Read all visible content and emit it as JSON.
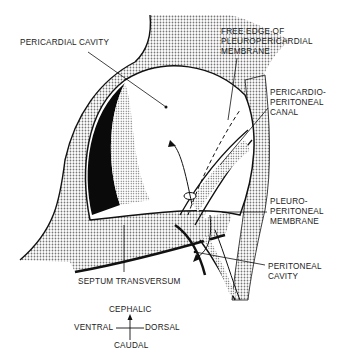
{
  "labels": {
    "pericardial_cavity": "PERICARDIAL CAVITY",
    "free_edge_1": "FREE EDGE OF",
    "free_edge_2": "PLEUROPERICARDIAL",
    "free_edge_3": "MEMBRANE",
    "pp_canal_1": "PERICARDIO-",
    "pp_canal_2": "PERITONEAL",
    "pp_canal_3": "CANAL",
    "pleuro_1": "PLEURO-",
    "pleuro_2": "PERITONEAL",
    "pleuro_3": "MEMBRANE",
    "septum": "SEPTUM TRANSVERSUM",
    "peritoneal_1": "PERITONEAL",
    "peritoneal_2": "CAVITY"
  },
  "orientation": {
    "cephalic": "CEPHALIC",
    "caudal": "CAUDAL",
    "ventral": "VENTRAL",
    "dorsal": "DORSAL"
  },
  "colors": {
    "ink": "#111111",
    "stipple": "#b8b8b8",
    "background": "#ffffff"
  }
}
